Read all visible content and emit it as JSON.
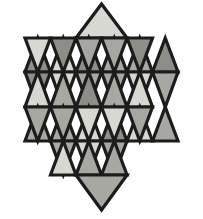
{
  "figure": {
    "name": "star-of-david-triangle-tessellation",
    "background_color": "#ffffff",
    "outline_color": "#1c1c1c",
    "outline_width": 3.2,
    "palette": {
      "light": "#d8d8d2",
      "medium": "#a8a8a2",
      "dark": "#8e8e88"
    },
    "geometry": {
      "center_x": 101.5,
      "left_x": 25,
      "right_x": 178,
      "top_y": 4,
      "bottom_y": 210,
      "row_ys": [
        4,
        38,
        72,
        107,
        141,
        175,
        210
      ],
      "cell_width": 25.5,
      "row_height": 34.3,
      "columns": 6,
      "rows": 6
    },
    "triangles": [
      {
        "id": "r0-up-c0",
        "row": 0,
        "col": 0,
        "orientation": "up",
        "shade": "light"
      },
      {
        "id": "r1-up-c0",
        "row": 1,
        "col": 0,
        "orientation": "up",
        "shade": "dark"
      },
      {
        "id": "r1-dn-c0",
        "row": 1,
        "col": 0,
        "orientation": "down",
        "shade": "light"
      },
      {
        "id": "r1-up-c1",
        "row": 1,
        "col": 1,
        "orientation": "up",
        "shade": "light"
      },
      {
        "id": "r1-dn-c1",
        "row": 1,
        "col": 1,
        "orientation": "down",
        "shade": "dark"
      },
      {
        "id": "r1-up-c2",
        "row": 1,
        "col": 2,
        "orientation": "up",
        "shade": "dark"
      },
      {
        "id": "r1-dn-c2",
        "row": 1,
        "col": 2,
        "orientation": "down",
        "shade": "medium"
      },
      {
        "id": "r1-up-c3",
        "row": 1,
        "col": 3,
        "orientation": "up",
        "shade": "medium"
      },
      {
        "id": "r1-dn-c3",
        "row": 1,
        "col": 3,
        "orientation": "down",
        "shade": "medium"
      },
      {
        "id": "r1-up-c4",
        "row": 1,
        "col": 4,
        "orientation": "up",
        "shade": "medium"
      },
      {
        "id": "r1-dn-c4",
        "row": 1,
        "col": 4,
        "orientation": "down",
        "shade": "dark"
      },
      {
        "id": "r1-up-c5",
        "row": 1,
        "col": 5,
        "orientation": "up",
        "shade": "dark"
      },
      {
        "id": "r2-dn-c0",
        "row": 2,
        "col": 0,
        "orientation": "down",
        "shade": "dark"
      },
      {
        "id": "r2-up-c0",
        "row": 2,
        "col": 0,
        "orientation": "up",
        "shade": "light"
      },
      {
        "id": "r2-dn-c1",
        "row": 2,
        "col": 1,
        "orientation": "down",
        "shade": "light"
      },
      {
        "id": "r2-up-c1",
        "row": 2,
        "col": 1,
        "orientation": "up",
        "shade": "medium"
      },
      {
        "id": "r2-dn-c2",
        "row": 2,
        "col": 2,
        "orientation": "down",
        "shade": "medium"
      },
      {
        "id": "r2-up-c2",
        "row": 2,
        "col": 2,
        "orientation": "up",
        "shade": "dark"
      },
      {
        "id": "r2-dn-c3",
        "row": 2,
        "col": 3,
        "orientation": "down",
        "shade": "medium"
      },
      {
        "id": "r2-up-c3",
        "row": 2,
        "col": 3,
        "orientation": "up",
        "shade": "medium"
      },
      {
        "id": "r2-dn-c4",
        "row": 2,
        "col": 4,
        "orientation": "down",
        "shade": "light"
      },
      {
        "id": "r2-up-c4",
        "row": 2,
        "col": 4,
        "orientation": "up",
        "shade": "light"
      },
      {
        "id": "r2-dn-c5",
        "row": 2,
        "col": 5,
        "orientation": "down",
        "shade": "medium"
      },
      {
        "id": "r3-up-c0",
        "row": 3,
        "col": 0,
        "orientation": "up",
        "shade": "medium"
      },
      {
        "id": "r3-dn-c0",
        "row": 3,
        "col": 0,
        "orientation": "down",
        "shade": "medium"
      },
      {
        "id": "r3-up-c1",
        "row": 3,
        "col": 1,
        "orientation": "up",
        "shade": "medium"
      },
      {
        "id": "r3-dn-c1",
        "row": 3,
        "col": 1,
        "orientation": "down",
        "shade": "medium"
      },
      {
        "id": "r3-up-c2",
        "row": 3,
        "col": 2,
        "orientation": "up",
        "shade": "light"
      },
      {
        "id": "r3-dn-c2",
        "row": 3,
        "col": 2,
        "orientation": "down",
        "shade": "light"
      },
      {
        "id": "r3-up-c3",
        "row": 3,
        "col": 3,
        "orientation": "up",
        "shade": "dark"
      },
      {
        "id": "r3-dn-c3",
        "row": 3,
        "col": 3,
        "orientation": "down",
        "shade": "light"
      },
      {
        "id": "r3-up-c4",
        "row": 3,
        "col": 4,
        "orientation": "up",
        "shade": "light"
      },
      {
        "id": "r3-dn-c4",
        "row": 3,
        "col": 4,
        "orientation": "down",
        "shade": "medium"
      },
      {
        "id": "r3-up-c5",
        "row": 3,
        "col": 5,
        "orientation": "up",
        "shade": "medium"
      },
      {
        "id": "r4-dn-c1",
        "row": 4,
        "col": 1,
        "orientation": "down",
        "shade": "medium"
      },
      {
        "id": "r4-up-c1",
        "row": 4,
        "col": 1,
        "orientation": "up",
        "shade": "light"
      },
      {
        "id": "r4-dn-c2",
        "row": 4,
        "col": 2,
        "orientation": "down",
        "shade": "light"
      },
      {
        "id": "r4-up-c2",
        "row": 4,
        "col": 2,
        "orientation": "up",
        "shade": "medium"
      },
      {
        "id": "r4-dn-c3",
        "row": 4,
        "col": 3,
        "orientation": "down",
        "shade": "medium"
      },
      {
        "id": "r4-up-c3",
        "row": 4,
        "col": 3,
        "orientation": "up",
        "shade": "medium"
      },
      {
        "id": "r5-dn-c2",
        "row": 5,
        "col": 2,
        "orientation": "down",
        "shade": "medium"
      }
    ]
  }
}
